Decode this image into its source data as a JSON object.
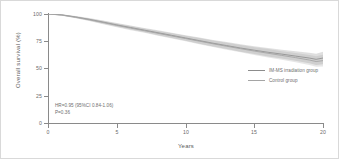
{
  "chart_data": {
    "type": "line",
    "title": "",
    "subtitle": "",
    "xlabel": "Years",
    "ylabel": "Overall survival (%)",
    "xlim": [
      0,
      20
    ],
    "ylim": [
      0,
      100
    ],
    "xticks": [
      "0",
      "5",
      "10",
      "15",
      "20"
    ],
    "yticks": [
      "0",
      "25",
      "50",
      "75",
      "100"
    ],
    "grid": false,
    "legend_position": "center-right",
    "annotations": [
      "HR=0.95 (95%CI 0.84-1.06)",
      "P=0.36"
    ],
    "x": [
      0,
      1,
      2,
      3,
      4,
      5,
      6,
      7,
      8,
      9,
      10,
      11,
      12,
      13,
      14,
      15,
      16,
      17,
      18,
      19,
      19.5,
      20
    ],
    "series": [
      {
        "name": "IM-MS irradiation group",
        "color": "#8c8c8c",
        "values": [
          100,
          99.2,
          97.3,
          95.1,
          92.6,
          90.0,
          87.6,
          85.2,
          82.8,
          80.4,
          78.0,
          75.6,
          73.2,
          71.0,
          68.8,
          66.8,
          64.9,
          63.2,
          61.4,
          59.6,
          58.4,
          59.6
        ],
        "ci_upper": [
          100,
          99.7,
          98.2,
          96.3,
          94.1,
          91.7,
          89.5,
          87.2,
          85.0,
          82.8,
          80.6,
          78.4,
          76.2,
          74.2,
          72.2,
          70.4,
          68.7,
          67.3,
          65.8,
          64.4,
          63.6,
          65.4
        ],
        "ci_lower": [
          100,
          98.7,
          96.4,
          93.9,
          91.1,
          88.3,
          85.7,
          83.2,
          80.6,
          78.0,
          75.4,
          72.8,
          70.2,
          67.8,
          65.4,
          63.2,
          61.1,
          59.1,
          57.0,
          54.8,
          53.2,
          53.8
        ]
      },
      {
        "name": "Control group",
        "color": "#a5a5a5",
        "values": [
          100,
          99.0,
          97.0,
          94.7,
          92.2,
          89.6,
          87.1,
          84.7,
          82.3,
          79.9,
          77.5,
          75.1,
          72.7,
          70.4,
          68.2,
          66.0,
          64.0,
          62.0,
          60.0,
          57.8,
          56.4,
          57.2
        ],
        "ci_upper": [
          100,
          99.5,
          97.9,
          95.9,
          93.7,
          91.3,
          89.0,
          86.7,
          84.5,
          82.3,
          80.1,
          77.9,
          75.7,
          73.6,
          71.6,
          69.6,
          67.8,
          65.9,
          64.2,
          62.4,
          61.2,
          62.6
        ],
        "ci_lower": [
          100,
          98.5,
          96.1,
          93.5,
          90.7,
          87.9,
          85.2,
          82.7,
          80.1,
          77.5,
          74.9,
          72.3,
          69.7,
          67.2,
          64.8,
          62.4,
          60.2,
          58.1,
          55.8,
          53.2,
          51.6,
          51.8
        ]
      }
    ]
  },
  "axes": {
    "y_title": "Overall survival (%)",
    "x_title": "Years",
    "y_tick_labels": [
      "100",
      "75",
      "50",
      "25",
      "0"
    ],
    "x_tick_labels": [
      "0",
      "5",
      "10",
      "15",
      "20"
    ]
  },
  "legend": {
    "items": [
      {
        "label": "IM-MS irradiation group",
        "color": "#8c8c8c"
      },
      {
        "label": "Control group",
        "color": "#a5a5a5"
      }
    ]
  },
  "stats": {
    "hazard_ratio_line": "HR=0.95 (95%CI 0.84-1.06)",
    "p_value_line": "P=0.36"
  }
}
